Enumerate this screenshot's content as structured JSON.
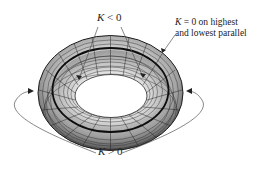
{
  "figure": {
    "labels": {
      "negative_curvature": {
        "var": "K",
        "rel": " < ",
        "val": "0"
      },
      "zero_curvature": {
        "var": "K",
        "rel": " = ",
        "val": "0",
        "line1_rest": " on highest",
        "line2": "and lowest parallel"
      },
      "positive_curvature": {
        "var": "K",
        "rel": " > ",
        "val": "0"
      }
    },
    "colors": {
      "surface_light": "#e6e6e6",
      "surface_mid": "#a8a8a8",
      "surface_dark": "#4a4a4a",
      "mesh": "#222222",
      "annotation": "#555555",
      "background": "#ffffff"
    }
  }
}
